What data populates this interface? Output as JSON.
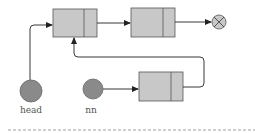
{
  "diagram": {
    "colors": {
      "node_fill": "#c8c8c8",
      "node_stroke": "#555555",
      "pointer_fill": "#8a8a8a",
      "null_fill": "#c8c8c8",
      "line": "#222222",
      "label": "#555555",
      "dash": "#888888"
    },
    "pointers": [
      {
        "id": "head",
        "label": "head"
      },
      {
        "id": "nn",
        "label": "nn"
      }
    ],
    "nodes": [
      {
        "id": "node-1",
        "role": "first node"
      },
      {
        "id": "node-2",
        "role": "second node"
      },
      {
        "id": "node-new",
        "role": "new node"
      }
    ],
    "null_terminator": {
      "icon": "null-x-icon"
    }
  }
}
